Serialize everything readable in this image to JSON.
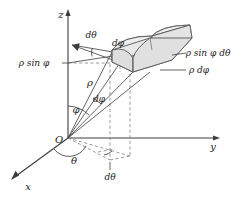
{
  "figure": {
    "background_color": "#ffffff",
    "line_color": "#3c3c3c",
    "solid_fill_color": "#e6e6e6",
    "solid_edge_color": "#555555",
    "dashed_color": "#8a8a8a"
  },
  "axes": {
    "z_label": "z",
    "y_label": "y",
    "x_label": "x",
    "origin_label": "O"
  },
  "labels": {
    "d_theta_top": "dθ",
    "d_phi_top": "dφ",
    "rho_sin_phi": "ρ sin φ",
    "rho_sin_phi_d_theta": "ρ sin φ dθ",
    "rho_d_phi": "ρ dφ",
    "rho": "ρ",
    "d_phi_mid": "dφ",
    "phi_angle": "φ",
    "theta_angle": "θ",
    "d_theta_bottom": "dθ"
  },
  "parts": {
    "volume_element": "volume-element-solid",
    "projection_lines": "dashed-projection-lines",
    "phi_arc": "phi-angle-arc",
    "theta_arc": "theta-angle-arc"
  }
}
